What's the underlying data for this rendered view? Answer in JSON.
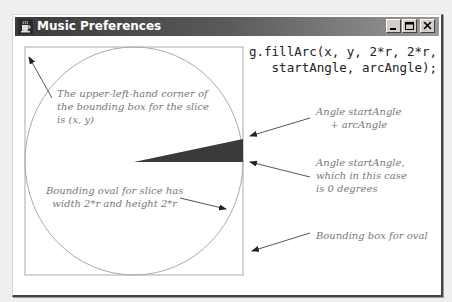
{
  "window": {
    "title": "Music Preferences",
    "app_icon": "java-coffee-cup-icon",
    "buttons": {
      "minimize": "minimize-icon",
      "maximize": "maximize-icon",
      "close": "close-icon"
    }
  },
  "code": {
    "line1": "g.fillArc(x, y, 2*r, 2*r,",
    "line2": "   startAngle, arcAngle);"
  },
  "annotations": {
    "upper_left": [
      "The upper-left-hand corner of",
      "the bounding box for the slice",
      "is (x, y)"
    ],
    "end_angle": [
      "Angle startAngle",
      "+ arcAngle"
    ],
    "start_angle": [
      "Angle startAngle,",
      "which in this case",
      "is 0 degrees"
    ],
    "oval": [
      "Bounding oval for slice has",
      "width 2*r and height 2*r"
    ],
    "box": [
      "Bounding box for oval"
    ]
  },
  "colors": {
    "wedge": "#3a3a3a",
    "outline": "#aaaaaa",
    "note_text": "#777777",
    "arrow": "#555555"
  }
}
